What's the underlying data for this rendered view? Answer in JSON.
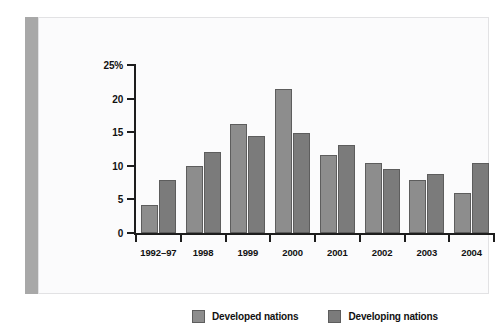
{
  "chart_data": {
    "type": "bar",
    "title": "",
    "xlabel": "",
    "ylabel": "",
    "grid": false,
    "legend_position": "bottom-center",
    "ylim": [
      0,
      25
    ],
    "ytick_labels": [
      "0",
      "5",
      "10",
      "15",
      "20",
      "25%"
    ],
    "ytick_values": [
      0,
      5,
      10,
      15,
      20,
      25
    ],
    "categories": [
      "1992–97",
      "1998",
      "1999",
      "2000",
      "2001",
      "2002",
      "2003",
      "2004"
    ],
    "series": [
      {
        "name": "Developed nations",
        "color": "#8d8d8d",
        "values": [
          4.2,
          9.9,
          16.2,
          21.4,
          11.6,
          10.4,
          7.9,
          6.0
        ]
      },
      {
        "name": "Developing nations",
        "color": "#7b7b7b",
        "values": [
          7.9,
          12.1,
          14.5,
          14.9,
          13.1,
          9.5,
          8.8,
          10.4
        ]
      }
    ]
  },
  "colors": {
    "accent_strip": "#a8a8a8",
    "panel_background": "#fbfbfc",
    "panel_border": "#e2e2e4",
    "axis": "#1d1d1d",
    "bar_outline": "#5d5d5d"
  }
}
